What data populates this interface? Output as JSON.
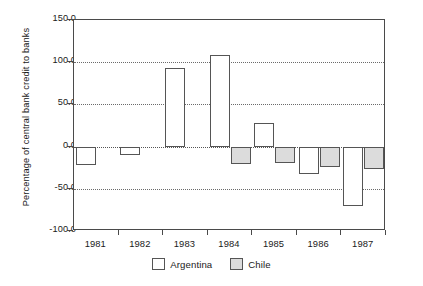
{
  "chart_data": {
    "type": "bar",
    "title": "",
    "xlabel": "",
    "ylabel": "Percentage of central bank credit to banks",
    "categories": [
      "1981",
      "1982",
      "1983",
      "1984",
      "1985",
      "1986",
      "1987"
    ],
    "series": [
      {
        "name": "Argentina",
        "color": "#ffffff",
        "values": [
          -22.0,
          -10.0,
          93.5,
          109.0,
          28.0,
          -33.0,
          -70.0
        ]
      },
      {
        "name": "Chile",
        "color": "#dcdcdc",
        "values": [
          null,
          null,
          null,
          -21.0,
          -19.0,
          -24.0,
          -27.0
        ]
      }
    ],
    "ylim": [
      -100.0,
      150.0
    ],
    "yticks": [
      150.0,
      100.0,
      50.0,
      0.0,
      -50.0,
      -100.0
    ],
    "ytick_labels": [
      "150.0",
      "100.0",
      "50.0",
      "0.0",
      "-50.0",
      "-100.0"
    ],
    "grid": true,
    "grid_axis": "y",
    "grid_style": "dotted",
    "legend_position": "bottom-center",
    "legend": [
      "Argentina",
      "Chile"
    ]
  },
  "axes": {
    "y_title": "Percentage of central bank credit to banks",
    "y_labels": [
      "150.0",
      "100.0",
      "50.0",
      "0.0",
      "-50.0",
      "-100.0"
    ],
    "x_labels": [
      "1981",
      "1982",
      "1983",
      "1984",
      "1985",
      "1986",
      "1987"
    ]
  },
  "legend": {
    "items": [
      {
        "label": "Argentina",
        "swatch": "legend-swatch-argentina"
      },
      {
        "label": "Chile",
        "swatch": "legend-swatch-chile"
      }
    ]
  },
  "colors": {
    "argentina_fill": "#ffffff",
    "chile_fill": "#dcdcdc",
    "bar_outline": "#555555",
    "frame": "#4a4a4a",
    "grid": "#6b6b6b",
    "text": "#1a1a1a",
    "background": "#ffffff"
  }
}
